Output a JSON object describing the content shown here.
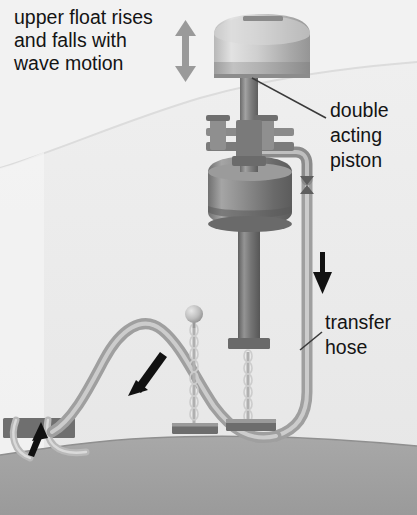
{
  "diagram": {
    "background_color": "#f2f2f2",
    "water_color": "#ededed",
    "seabed_color": "#a3a3a3",
    "metal_dark": "#6e6e6e",
    "metal_mid": "#8f8f8f",
    "metal_light": "#c9c9c9",
    "hose_color": "#b4b4b4",
    "arrow_black": "#111111",
    "arrow_grey": "#9a9a9a",
    "labels": [
      {
        "id": "upper-float",
        "name": "upper-float-label",
        "lines": [
          "upper float rises",
          "and falls with",
          "wave motion"
        ],
        "x": 14,
        "y": 24
      },
      {
        "id": "double-acting-piston",
        "name": "double-acting-piston-label",
        "lines": [
          "double",
          "acting",
          "piston"
        ],
        "x": 330,
        "y": 117
      },
      {
        "id": "transfer-hose",
        "name": "transfer-hose-label",
        "lines": [
          "transfer",
          "hose"
        ],
        "x": 325,
        "y": 329
      }
    ],
    "arrows": [
      {
        "id": "wave-motion",
        "name": "wave-motion-double-arrow",
        "direction": "up-down",
        "color": "#9a9a9a"
      },
      {
        "id": "hose-flow-down",
        "name": "hose-flow-down-arrow",
        "direction": "down",
        "color": "#111111"
      },
      {
        "id": "seabed-flow-left",
        "name": "seabed-flow-left-arrow",
        "direction": "down-left",
        "color": "#111111"
      },
      {
        "id": "outlet-flow-up",
        "name": "outlet-flow-up-arrow",
        "direction": "up-left",
        "color": "#111111"
      }
    ],
    "components": [
      {
        "id": "upper-float",
        "name": "upper-float-cylinder"
      },
      {
        "id": "piston-body",
        "name": "piston-body-cylinder"
      },
      {
        "id": "valve-left",
        "name": "left-valve-stem"
      },
      {
        "id": "valve-right",
        "name": "right-valve-stem"
      },
      {
        "id": "piston-rod",
        "name": "piston-rod"
      },
      {
        "id": "lower-shaft",
        "name": "lower-shaft-column"
      },
      {
        "id": "transfer-hose",
        "name": "transfer-hose-pipe"
      },
      {
        "id": "chain-left",
        "name": "left-mooring-chain"
      },
      {
        "id": "chain-right",
        "name": "right-mooring-chain"
      },
      {
        "id": "float-ball",
        "name": "chain-float-ball"
      },
      {
        "id": "anchor-left",
        "name": "left-anchor-block"
      },
      {
        "id": "anchor-right",
        "name": "right-anchor-block"
      },
      {
        "id": "outlet-platform",
        "name": "seabed-outlet-platform"
      },
      {
        "id": "seabed",
        "name": "seabed"
      },
      {
        "id": "water-surface",
        "name": "water-surface-line"
      }
    ]
  }
}
